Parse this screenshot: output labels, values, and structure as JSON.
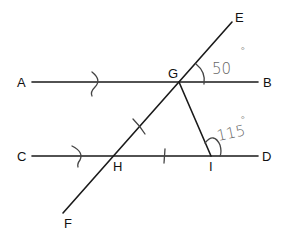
{
  "diagram": {
    "type": "geometry",
    "points": {
      "A": {
        "label": "A"
      },
      "B": {
        "label": "B"
      },
      "C": {
        "label": "C"
      },
      "D": {
        "label": "D"
      },
      "E": {
        "label": "E"
      },
      "F": {
        "label": "F"
      },
      "G": {
        "label": "G"
      },
      "H": {
        "label": "H"
      },
      "I": {
        "label": "I"
      }
    },
    "lines": [
      {
        "name": "AB",
        "from": "A",
        "to": "B",
        "parallel_mark": ">"
      },
      {
        "name": "CD",
        "from": "C",
        "to": "D",
        "parallel_mark": ">"
      },
      {
        "name": "EF",
        "from": "E",
        "to": "F",
        "role": "transversal"
      },
      {
        "name": "GI",
        "from": "G",
        "to": "I"
      }
    ],
    "equal_segments": [
      "GH",
      "HI"
    ],
    "angles": [
      {
        "name": "EGB",
        "label": "50°",
        "value_text": "50",
        "degree_symbol": "°"
      },
      {
        "name": "GID",
        "label": "115°",
        "value_text": "115",
        "degree_symbol": "°"
      }
    ],
    "colors": {
      "line": "#1a1a1a",
      "handwriting": "#666666",
      "background": "#ffffff"
    }
  }
}
